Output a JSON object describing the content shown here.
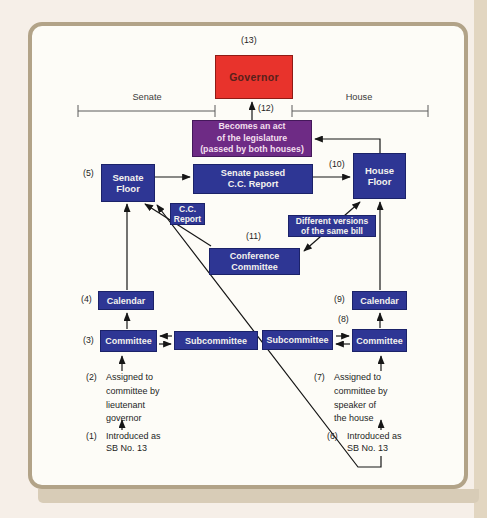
{
  "diagram": {
    "brackets": {
      "senate_label": "Senate",
      "house_label": "House"
    },
    "nodes": {
      "governor": {
        "num": "(13)",
        "label": "Governor"
      },
      "act": {
        "num": "(12)",
        "lines": [
          "Becomes an act",
          "of the legislature",
          "(passed by both houses)"
        ]
      },
      "senate_floor": {
        "num": "(5)",
        "lines": [
          "Senate",
          "Floor"
        ]
      },
      "senate_passed_cc": {
        "lines": [
          "Senate passed",
          "C.C. Report"
        ]
      },
      "house_floor": {
        "num": "(10)",
        "lines": [
          "House",
          "Floor"
        ]
      },
      "cc_report": {
        "lines": [
          "C.C.",
          "Report"
        ]
      },
      "conference_committee": {
        "num": "(11)",
        "lines": [
          "Conference",
          "Committee"
        ]
      },
      "different_versions": {
        "lines": [
          "Different versions",
          "of the same bill"
        ]
      },
      "calendar_senate": {
        "num": "(4)",
        "label": "Calendar"
      },
      "committee_senate": {
        "num": "(3)",
        "label": "Committee"
      },
      "subcommittee_senate": {
        "label": "Subcommittee"
      },
      "calendar_house": {
        "num": "(9)",
        "label": "Calendar"
      },
      "committee_house": {
        "num": "(8)",
        "label": "Committee"
      },
      "subcommittee_house": {
        "label": "Subcommittee"
      },
      "assigned_senate": {
        "num": "(2)",
        "lines": [
          "Assigned to",
          "committee by",
          "lieutenant",
          "governor"
        ]
      },
      "introduced_senate": {
        "num": "(1)",
        "lines": [
          "Introduced as",
          "SB No. 13"
        ]
      },
      "assigned_house": {
        "num": "(7)",
        "lines": [
          "Assigned to",
          "committee by",
          "speaker of",
          "the house"
        ]
      },
      "introduced_house": {
        "num": "(6)",
        "lines": [
          "Introduced as",
          "SB No. 13"
        ]
      }
    },
    "colors": {
      "box_blue": "#2e3694",
      "box_red": "#e8332c",
      "box_purple": "#6e2b85",
      "frame_tan": "#b2a388",
      "line_black": "#161616"
    }
  }
}
